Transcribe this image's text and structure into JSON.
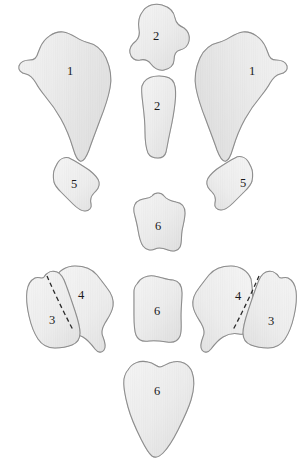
{
  "figure": {
    "background_color": "#ffffff",
    "width": 306,
    "height": 467,
    "style": {
      "shape_fill_light": "#f3f3f3",
      "shape_fill_mid": "#e4e4e4",
      "shape_fill_shadow": "#d2d2d2",
      "outline_color": "#8d8d8d",
      "suture_color": "#2b2b2b",
      "label_color": "#1a1a1a",
      "hatch_color": "#dcdcdc"
    }
  },
  "elements": [
    {
      "id": "element-1-left",
      "label": "1",
      "label_x": 70,
      "label_y": 72,
      "side": "left",
      "has_suture": false
    },
    {
      "id": "element-1-right",
      "label": "1",
      "label_x": 252,
      "label_y": 72,
      "side": "right",
      "has_suture": false
    },
    {
      "id": "element-2-upper",
      "label": "2",
      "label_x": 156,
      "label_y": 37,
      "side": "center",
      "has_suture": false
    },
    {
      "id": "element-2-lower",
      "label": "2",
      "label_x": 157,
      "label_y": 107,
      "side": "center",
      "has_suture": false
    },
    {
      "id": "element-5-left",
      "label": "5",
      "label_x": 74,
      "label_y": 185,
      "side": "left",
      "has_suture": false
    },
    {
      "id": "element-5-right",
      "label": "5",
      "label_x": 243,
      "label_y": 184,
      "side": "right",
      "has_suture": false
    },
    {
      "id": "element-6-middle",
      "label": "6",
      "label_x": 158,
      "label_y": 227,
      "side": "center",
      "has_suture": false
    },
    {
      "id": "element-3-left",
      "label": "3",
      "label_x": 52,
      "label_y": 321,
      "side": "left",
      "has_suture": true
    },
    {
      "id": "element-4-left",
      "label": "4",
      "label_x": 81,
      "label_y": 296,
      "side": "left",
      "has_suture": true
    },
    {
      "id": "element-4-right",
      "label": "4",
      "label_x": 238,
      "label_y": 297,
      "side": "right",
      "has_suture": true
    },
    {
      "id": "element-3-right",
      "label": "3",
      "label_x": 271,
      "label_y": 322,
      "side": "right",
      "has_suture": true
    },
    {
      "id": "element-6-lower",
      "label": "6",
      "label_x": 157,
      "label_y": 312,
      "side": "center",
      "has_suture": false
    },
    {
      "id": "element-6-bottom",
      "label": "6",
      "label_x": 157,
      "label_y": 392,
      "side": "center",
      "has_suture": false
    }
  ],
  "labels": {
    "one_left": "1",
    "one_right": "1",
    "two_upper": "2",
    "two_lower": "2",
    "five_left": "5",
    "five_right": "5",
    "six_middle": "6",
    "three_left": "3",
    "four_left": "4",
    "four_right": "4",
    "three_right": "3",
    "six_lower": "6",
    "six_bottom": "6"
  }
}
